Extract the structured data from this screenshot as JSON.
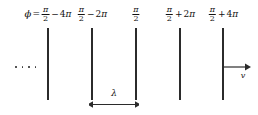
{
  "figure": {
    "background_color": "#ffffff",
    "line_color": "#2b2b2b",
    "text_color": "#111111",
    "phase_prefix": "ϕ",
    "equals": "=",
    "labels": [
      {
        "id": "phase-1",
        "numerator": "π",
        "denominator": "2",
        "operator": "−",
        "coefficient": "4",
        "unit": "π",
        "full_text": "ϕ = π/2 − 4π",
        "x": 48
      },
      {
        "id": "phase-2",
        "numerator": "π",
        "denominator": "2",
        "operator": "−",
        "coefficient": "2",
        "unit": "π",
        "full_text": "π/2 − 2π",
        "x": 92
      },
      {
        "id": "phase-3",
        "numerator": "π",
        "denominator": "2",
        "operator": "",
        "coefficient": "",
        "unit": "",
        "full_text": "π/2",
        "x": 136
      },
      {
        "id": "phase-4",
        "numerator": "π",
        "denominator": "2",
        "operator": "+",
        "coefficient": "2",
        "unit": "π",
        "full_text": "π/2 + 2π",
        "x": 180
      },
      {
        "id": "phase-5",
        "numerator": "π",
        "denominator": "2",
        "operator": "+",
        "coefficient": "4",
        "unit": "π",
        "full_text": "π/2 + 4π",
        "x": 223
      }
    ],
    "wavefronts": [
      {
        "id": "wavefront-1",
        "x": 48,
        "top": 28,
        "bottom": 100
      },
      {
        "id": "wavefront-2",
        "x": 92,
        "top": 28,
        "bottom": 100
      },
      {
        "id": "wavefront-3",
        "x": 136,
        "top": 28,
        "bottom": 100
      },
      {
        "id": "wavefront-4",
        "x": 180,
        "top": 28,
        "bottom": 100
      },
      {
        "id": "wavefront-5",
        "x": 223,
        "top": 28,
        "bottom": 100
      }
    ],
    "ellipsis": {
      "dot_count": 4,
      "x": 15,
      "y": 67
    },
    "wavelength": {
      "symbol": "λ",
      "label_x": 114,
      "label_y": 88,
      "arrow_y": 104,
      "arrow_left": 92,
      "arrow_right": 136
    },
    "velocity": {
      "symbol": "v",
      "arrow_y": 67,
      "arrow_left": 223,
      "arrow_right": 247,
      "label_x": 243,
      "label_y": 72
    }
  }
}
